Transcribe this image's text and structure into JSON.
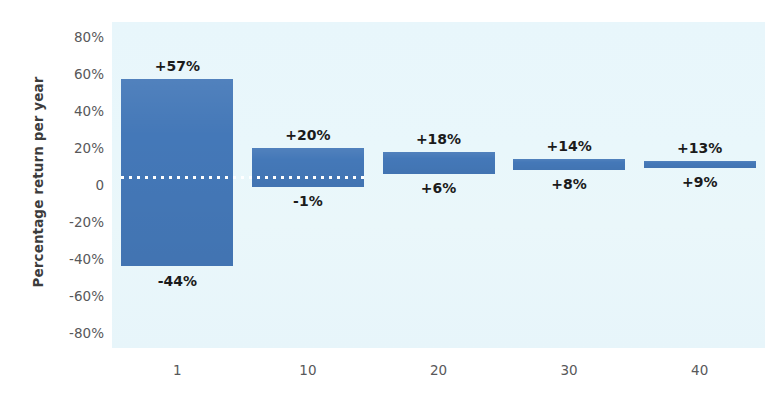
{
  "chart_data": {
    "type": "bar",
    "title": "",
    "subtitle": "",
    "xlabel": "",
    "ylabel": "Percentage return per year",
    "categories": [
      "1",
      "10",
      "20",
      "30",
      "40"
    ],
    "x_tick_labels": [
      "1",
      "10",
      "20",
      "30",
      "40"
    ],
    "y_tick_labels": [
      "80%",
      "60%",
      "40%",
      "20%",
      "0",
      "-20%",
      "-40%",
      "-60%",
      "-80%"
    ],
    "y_tick_values": [
      80,
      60,
      40,
      20,
      0,
      -20,
      -40,
      -60,
      -80
    ],
    "ylim": [
      -88,
      88
    ],
    "grid": false,
    "legend": "none",
    "series": [
      {
        "name": "Range of annualised returns (best to worst)",
        "bars": [
          {
            "category": "1",
            "high": 57,
            "low": -44,
            "high_label": "+57%",
            "low_label": "-44%"
          },
          {
            "category": "10",
            "high": 20,
            "low": -1,
            "high_label": "+20%",
            "low_label": "-1%"
          },
          {
            "category": "20",
            "high": 18,
            "low": 6,
            "high_label": "+18%",
            "low_label": "+6%"
          },
          {
            "category": "30",
            "high": 14,
            "low": 8,
            "high_label": "+14%",
            "low_label": "+8%"
          },
          {
            "category": "40",
            "high": 13,
            "low": 9,
            "high_label": "+13%",
            "low_label": "+9%"
          }
        ]
      }
    ],
    "annotations": [
      {
        "name": "average-return-dotted-line",
        "type": "dotted-line",
        "value": 4,
        "spans_categories": [
          "1",
          "10"
        ],
        "style": "white dotted"
      }
    ],
    "colors": {
      "bar": "#4478b8",
      "plot_background": "#eaf7fa",
      "page_background": "#ffffff",
      "tick_text": "#58585a",
      "value_label_text": "#1b1b1b",
      "axis_title_text": "#3c3c3c",
      "dotted_line": "#ffffff"
    }
  }
}
